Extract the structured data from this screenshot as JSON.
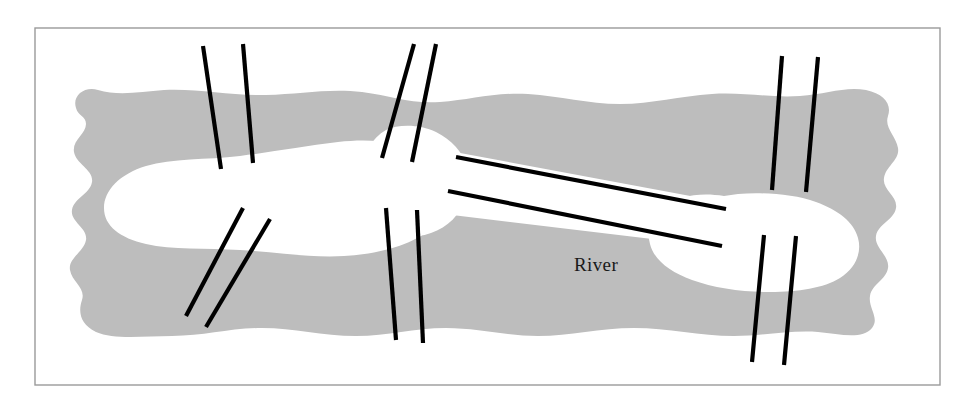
{
  "figure": {
    "width": 971,
    "height": 409,
    "background_color": "#ffffff"
  },
  "frame": {
    "name": "figure-border",
    "stroke_color": "#9a9a9a",
    "stroke_width": 1.4,
    "x": 35,
    "y": 28,
    "width": 905,
    "height": 357
  },
  "labels": {
    "river": "River",
    "river_x": 596,
    "river_y": 271
  },
  "colors": {
    "water": "#bdbdbd",
    "land": "#ffffff",
    "bridge": "#000000",
    "border": "#9a9a9a",
    "text": "#1a1a1a"
  },
  "water": {
    "name": "river-water-body",
    "fill": "#bdbdbd",
    "path": "M 76 108 C 72 96, 84 86, 98 90 C 118 96, 140 92, 164 90 C 196 88, 232 96, 266 95 C 300 94, 330 88, 362 92 C 392 96, 410 104, 440 102 C 470 100, 496 92, 528 94 C 560 96, 588 104, 620 104 C 652 104, 680 96, 712 94 C 744 92, 770 98, 800 96 C 826 94, 846 86, 866 90 C 884 94, 892 104, 888 116 C 884 128, 896 136, 898 148 C 900 160, 886 166, 884 178 C 882 190, 898 196, 896 208 C 894 220, 878 224, 876 236 C 874 248, 890 256, 888 268 C 886 280, 872 284, 870 296 C 868 308, 880 318, 872 328 C 862 340, 840 334, 818 332 C 790 330, 762 336, 734 336 C 700 336, 668 328, 634 328 C 600 328, 570 336, 538 336 C 506 336, 478 328, 446 328 C 414 328, 388 336, 356 336 C 322 336, 294 328, 262 328 C 230 328, 204 336, 172 336 C 144 336, 114 340, 96 332 C 80 324, 78 312, 82 300 C 86 288, 72 282, 70 270 C 68 258, 84 252, 86 240 C 88 228, 70 222, 72 210 C 74 198, 90 194, 92 182 C 94 170, 76 164, 74 152 C 72 140, 86 134, 86 124 C 86 116, 78 116, 76 108 Z"
  },
  "land_masses": [
    {
      "name": "left-island",
      "fill": "#ffffff",
      "path": "M 420 150 C 400 142, 370 138, 338 142 C 304 146, 272 152, 240 156 C 206 160, 172 158, 146 166 C 120 174, 104 190, 104 208 C 104 226, 120 238, 146 244 C 172 250, 206 248, 240 250 C 276 252, 310 258, 344 256 C 378 254, 406 246, 424 234 C 440 222, 444 196, 438 176 C 434 162, 430 154, 420 150 Z"
    },
    {
      "name": "center-node",
      "fill": "#ffffff",
      "path": "M 386 130 C 398 124, 420 124, 436 132 C 452 140, 462 152, 466 164 C 470 178, 468 196, 460 210 C 452 224, 436 234, 418 236 C 400 238, 384 232, 374 222 C 362 210, 358 192, 360 174 C 362 154, 372 138, 386 130 Z"
    },
    {
      "name": "isthmus-land-bridge",
      "fill": "#ffffff",
      "path": "M 444 150 L 744 206 L 744 250 L 444 214 Z"
    },
    {
      "name": "right-island",
      "fill": "#ffffff",
      "path": "M 724 196 C 700 192, 678 196, 664 206 C 650 216, 646 230, 650 244 C 654 260, 670 272, 692 280 C 714 288, 742 292, 770 292 C 798 292, 824 288, 840 278 C 856 268, 862 252, 858 238 C 854 222, 838 210, 816 202 C 794 194, 762 192, 738 194 Z"
    }
  ],
  "bridges": [
    {
      "name": "bridge-1-upper-left",
      "lines": [
        {
          "x1": 203,
          "y1": 46,
          "x2": 221,
          "y2": 169
        },
        {
          "x1": 243,
          "y1": 44,
          "x2": 253,
          "y2": 163
        }
      ]
    },
    {
      "name": "bridge-2-upper-center",
      "lines": [
        {
          "x1": 414,
          "y1": 44,
          "x2": 382,
          "y2": 158
        },
        {
          "x1": 436,
          "y1": 44,
          "x2": 412,
          "y2": 162
        }
      ]
    },
    {
      "name": "bridge-3-upper-right",
      "lines": [
        {
          "x1": 782,
          "y1": 56,
          "x2": 772,
          "y2": 190
        },
        {
          "x1": 818,
          "y1": 57,
          "x2": 806,
          "y2": 192
        }
      ]
    },
    {
      "name": "bridge-4-lower-left",
      "lines": [
        {
          "x1": 243,
          "y1": 208,
          "x2": 186,
          "y2": 316
        },
        {
          "x1": 270,
          "y1": 219,
          "x2": 206,
          "y2": 327
        }
      ]
    },
    {
      "name": "bridge-5-lower-center",
      "lines": [
        {
          "x1": 386,
          "y1": 208,
          "x2": 396,
          "y2": 340
        },
        {
          "x1": 417,
          "y1": 210,
          "x2": 423,
          "y2": 343
        }
      ]
    },
    {
      "name": "bridge-6-lower-right",
      "lines": [
        {
          "x1": 764,
          "y1": 235,
          "x2": 752,
          "y2": 362
        },
        {
          "x1": 796,
          "y1": 236,
          "x2": 784,
          "y2": 365
        }
      ]
    },
    {
      "name": "bridge-7-isthmus",
      "lines": [
        {
          "x1": 456,
          "y1": 157,
          "x2": 726,
          "y2": 209
        },
        {
          "x1": 448,
          "y1": 191,
          "x2": 722,
          "y2": 246
        }
      ]
    }
  ],
  "bridge_style": {
    "stroke": "#000000",
    "stroke_width": 4.2,
    "linecap": "butt"
  }
}
